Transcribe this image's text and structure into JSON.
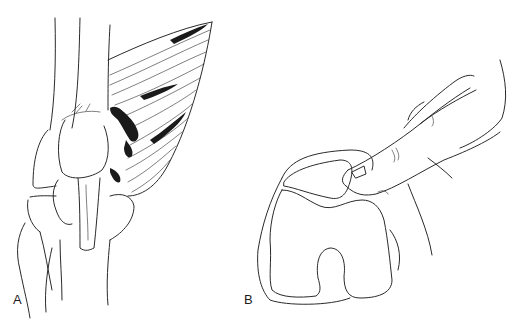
{
  "figure": {
    "panels": [
      {
        "id": "A",
        "label": "A",
        "description": "Knee anatomy drawing with torn quadriceps muscle fibers"
      },
      {
        "id": "B",
        "label": "B",
        "description": "Finger palpating patella over femoral condyles"
      }
    ],
    "colors": {
      "line": "#2a2a2a",
      "background": "#ffffff"
    }
  }
}
